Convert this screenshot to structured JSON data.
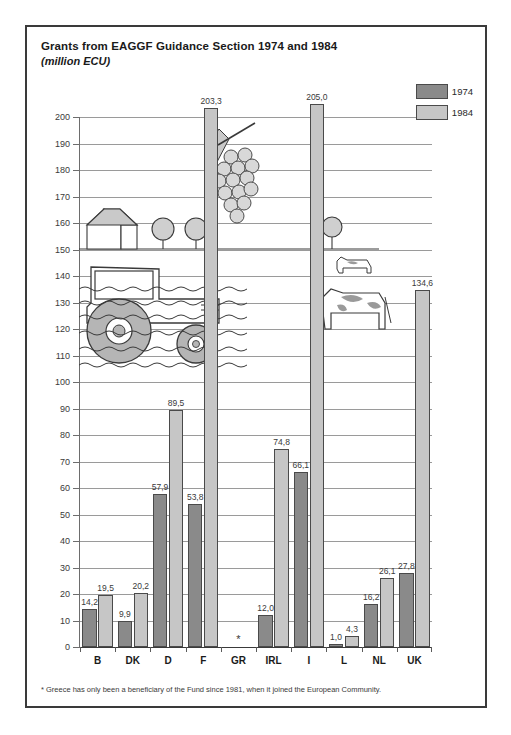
{
  "chart_data": {
    "type": "bar",
    "title": "Grants from EAGGF Guidance Section 1974 and 1984",
    "subtitle": "(million ECU)",
    "xlabel": "",
    "ylabel": "",
    "ylim": [
      0,
      200
    ],
    "ytick_step": 10,
    "grid": true,
    "legend_position": "top-right",
    "categories": [
      "B",
      "DK",
      "D",
      "F",
      "GR",
      "IRL",
      "I",
      "L",
      "NL",
      "UK"
    ],
    "series": [
      {
        "name": "1974",
        "color": "#8a8a8a",
        "values": [
          14.2,
          9.9,
          57.9,
          53.8,
          null,
          12.0,
          66.1,
          1.0,
          16.2,
          27.8
        ],
        "labels": [
          "14,2",
          "9,9",
          "57,9",
          "53,8",
          "",
          "12,0",
          "66,1",
          "1,0",
          "16,2",
          "27,8"
        ]
      },
      {
        "name": "1984",
        "color": "#c6c6c6",
        "values": [
          19.5,
          20.2,
          89.5,
          203.3,
          null,
          74.8,
          205.0,
          4.3,
          26.1,
          134.6
        ],
        "labels": [
          "19,5",
          "20,2",
          "89,5",
          "203,3",
          "",
          "74,8",
          "205,0",
          "4,3",
          "26,1",
          "134,6"
        ]
      }
    ],
    "ytick_labels": [
      "0",
      "10",
      "20",
      "30",
      "40",
      "50",
      "60",
      "70",
      "80",
      "90",
      "100",
      "110",
      "120",
      "130",
      "140",
      "150",
      "160",
      "170",
      "180",
      "190",
      "200"
    ],
    "annotations": [
      {
        "category": "GR",
        "marker": "*",
        "note": "no bars shown for Greece"
      }
    ],
    "footnote": "* Greece has only been a beneficiary of the Fund since 1981, when it joined the European Community."
  },
  "legend": {
    "items": [
      {
        "label": "1974",
        "color": "#8a8a8a"
      },
      {
        "label": "1984",
        "color": "#c6c6c6"
      }
    ]
  },
  "illustration": {
    "name": "agriculture-scene",
    "elements": [
      "farmhouse",
      "trees",
      "grape-bunch",
      "tractor",
      "cow-large",
      "cow-small",
      "field-rows"
    ]
  }
}
